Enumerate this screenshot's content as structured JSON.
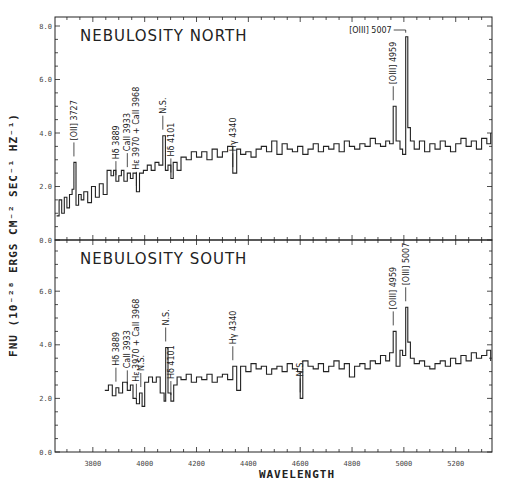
{
  "chart_data": {
    "type": "line",
    "style": "step",
    "xlabel": "WAVELENGTH",
    "ylabel": "FNU (10⁻²⁸ ERGS CM⁻² SEC⁻¹ HZ⁻¹)",
    "xlim": [
      3654,
      5340
    ],
    "x_ticks": [
      3800,
      4000,
      4200,
      4400,
      4600,
      4800,
      5000,
      5200
    ],
    "grid": false,
    "panels": [
      {
        "title": "NEBULOSITY NORTH",
        "ylim": [
          0,
          8.3
        ],
        "y_ticks": [
          "0.0",
          "2.0",
          "4.0",
          "6.0",
          "8.0"
        ],
        "y_tick_values": [
          0,
          2,
          4,
          6,
          8
        ],
        "spectrum": {
          "x": [
            3660,
            3670,
            3680,
            3690,
            3700,
            3710,
            3720,
            3727,
            3735,
            3745,
            3755,
            3765,
            3780,
            3795,
            3810,
            3825,
            3840,
            3855,
            3870,
            3880,
            3889,
            3900,
            3910,
            3920,
            3933,
            3945,
            3955,
            3968,
            3980,
            3995,
            4010,
            4025,
            4040,
            4055,
            4070,
            4080,
            4090,
            4101,
            4110,
            4125,
            4140,
            4160,
            4180,
            4200,
            4220,
            4240,
            4260,
            4280,
            4300,
            4320,
            4340,
            4355,
            4370,
            4390,
            4410,
            4430,
            4450,
            4470,
            4490,
            4510,
            4530,
            4550,
            4570,
            4590,
            4610,
            4630,
            4650,
            4670,
            4690,
            4710,
            4730,
            4750,
            4770,
            4790,
            4810,
            4830,
            4850,
            4870,
            4890,
            4910,
            4930,
            4945,
            4959,
            4970,
            4985,
            4995,
            5007,
            5015,
            5025,
            5040,
            5060,
            5080,
            5100,
            5120,
            5140,
            5160,
            5180,
            5200,
            5220,
            5240,
            5260,
            5280,
            5300,
            5320,
            5335
          ],
          "values": [
            0.9,
            1.5,
            1.0,
            1.6,
            1.2,
            1.7,
            1.9,
            2.9,
            1.3,
            1.7,
            1.5,
            1.8,
            1.4,
            2.0,
            1.6,
            2.1,
            1.7,
            2.6,
            2.4,
            2.6,
            2.2,
            2.4,
            2.6,
            2.2,
            2.5,
            2.3,
            2.5,
            1.8,
            2.5,
            2.6,
            2.8,
            2.6,
            2.9,
            2.8,
            3.9,
            2.6,
            2.8,
            2.3,
            2.9,
            2.6,
            3.1,
            3.0,
            3.3,
            3.1,
            3.3,
            3.0,
            3.4,
            3.1,
            3.3,
            3.5,
            2.5,
            3.4,
            3.2,
            3.3,
            3.1,
            3.4,
            3.5,
            3.3,
            3.7,
            3.2,
            3.6,
            3.4,
            3.3,
            3.5,
            3.2,
            3.4,
            3.6,
            3.3,
            3.5,
            3.4,
            3.6,
            3.3,
            3.7,
            3.5,
            3.4,
            3.6,
            3.5,
            3.8,
            3.6,
            3.5,
            3.7,
            3.6,
            5.0,
            3.7,
            3.4,
            3.2,
            7.6,
            4.2,
            3.7,
            3.4,
            3.7,
            3.3,
            3.6,
            3.4,
            3.7,
            3.5,
            3.3,
            3.6,
            3.8,
            3.5,
            3.7,
            3.4,
            3.8,
            3.6,
            4.0
          ]
        },
        "annotations": [
          {
            "label": "[OII] 3727",
            "x": 3727
          },
          {
            "label": "Hδ 3889",
            "x": 3889
          },
          {
            "label": "CaII 3933",
            "x": 3933
          },
          {
            "label": "Hε 3970 + CaII 3968",
            "x": 3968
          },
          {
            "label": "N.S.",
            "x": 4070
          },
          {
            "label": "Hδ 4101",
            "x": 4101
          },
          {
            "label": "Hγ 4340",
            "x": 4340
          },
          {
            "label": "[OIII] 4959",
            "x": 4959
          },
          {
            "label": "[OIII] 5007",
            "x": 5007
          }
        ]
      },
      {
        "title": "NEBULOSITY SOUTH",
        "ylim": [
          0,
          7.8
        ],
        "y_ticks": [
          "0.0",
          "2.0",
          "4.0",
          "6.0"
        ],
        "y_tick_values": [
          0,
          2,
          4,
          6
        ],
        "spectrum": {
          "x": [
            3846,
            3860,
            3875,
            3889,
            3900,
            3915,
            3933,
            3945,
            3955,
            3968,
            3980,
            3990,
            4000,
            4015,
            4030,
            4045,
            4060,
            4075,
            4081,
            4090,
            4101,
            4112,
            4125,
            4140,
            4160,
            4180,
            4200,
            4220,
            4240,
            4260,
            4280,
            4300,
            4320,
            4340,
            4355,
            4370,
            4390,
            4410,
            4430,
            4450,
            4470,
            4490,
            4510,
            4530,
            4550,
            4570,
            4590,
            4600,
            4610,
            4630,
            4650,
            4670,
            4690,
            4710,
            4730,
            4750,
            4770,
            4790,
            4810,
            4830,
            4850,
            4870,
            4890,
            4910,
            4930,
            4945,
            4959,
            4970,
            4985,
            4995,
            5007,
            5015,
            5025,
            5040,
            5060,
            5080,
            5100,
            5120,
            5140,
            5160,
            5180,
            5200,
            5220,
            5240,
            5260,
            5280,
            5300,
            5320,
            5335
          ],
          "values": [
            2.3,
            2.5,
            2.1,
            2.4,
            2.2,
            2.6,
            2.3,
            2.5,
            2.0,
            1.8,
            2.2,
            1.7,
            2.6,
            2.8,
            2.6,
            2.8,
            2.2,
            1.9,
            3.9,
            2.2,
            1.9,
            2.5,
            2.8,
            2.7,
            2.9,
            2.6,
            2.8,
            2.7,
            2.9,
            2.6,
            2.8,
            2.9,
            2.7,
            3.2,
            2.3,
            3.2,
            3.0,
            3.3,
            3.1,
            3.2,
            2.9,
            3.1,
            3.2,
            3.0,
            3.3,
            3.1,
            3.0,
            2.0,
            3.4,
            3.2,
            3.1,
            3.3,
            3.0,
            3.2,
            3.4,
            3.1,
            3.3,
            2.8,
            3.2,
            3.3,
            3.1,
            3.4,
            3.3,
            3.6,
            3.4,
            3.7,
            4.5,
            3.2,
            3.8,
            3.6,
            5.4,
            4.1,
            3.5,
            3.3,
            3.4,
            3.2,
            3.1,
            3.3,
            3.4,
            3.2,
            3.5,
            3.3,
            3.6,
            3.4,
            3.7,
            3.5,
            3.6,
            3.8,
            3.4
          ]
        },
        "annotations": [
          {
            "label": "Hδ 3889",
            "x": 3889
          },
          {
            "label": "CaII 3933",
            "x": 3933
          },
          {
            "label": "Hε 3970 + CaII 3968",
            "x": 3968
          },
          {
            "label": "N.S.",
            "x": 3985
          },
          {
            "label": "N.S.",
            "x": 4081
          },
          {
            "label": "Hδ 4101",
            "x": 4101
          },
          {
            "label": "Hγ 4340",
            "x": 4340
          },
          {
            "label": "N.S.",
            "x": 4600
          },
          {
            "label": "[OIII] 4959",
            "x": 4959
          },
          {
            "label": "[OIII] 5007",
            "x": 5007
          }
        ]
      }
    ]
  },
  "colors": {
    "ink": "#222222",
    "paper": "#ffffff",
    "tick_text": "#444444"
  }
}
